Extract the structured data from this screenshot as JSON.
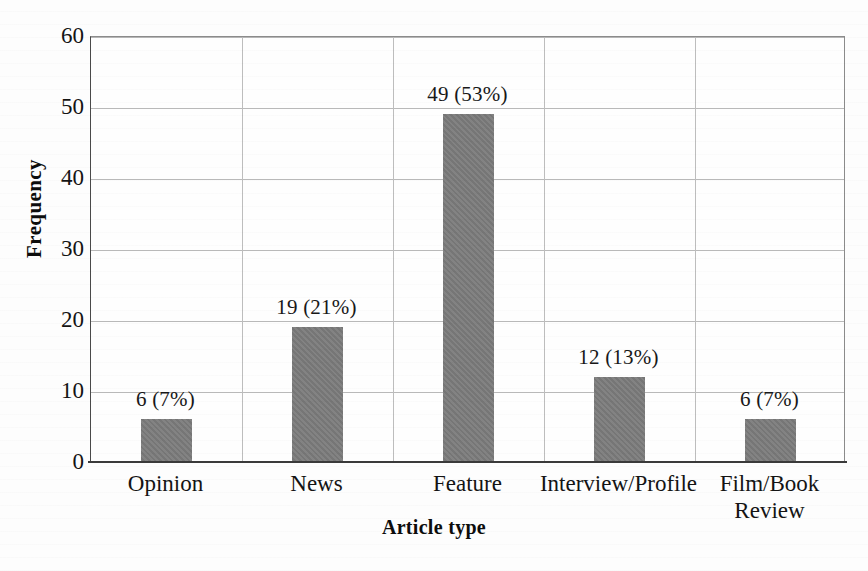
{
  "chart_data": {
    "type": "bar",
    "title": "",
    "xlabel": "Article type",
    "ylabel": "Frequency",
    "categories": [
      "Opinion",
      "News",
      "Feature",
      "Interview/Profile",
      "Film/Book\nReview"
    ],
    "values": [
      6,
      19,
      49,
      12,
      6
    ],
    "percentages": [
      7,
      21,
      53,
      13,
      7
    ],
    "point_labels": [
      "6 (7%)",
      "19 (21%)",
      "49 (53%)",
      "12 (13%)",
      "6 (7%)"
    ],
    "ylim": [
      0,
      60
    ],
    "yticks": [
      0,
      10,
      20,
      30,
      40,
      50,
      60
    ],
    "ytick_labels": [
      "0",
      "10",
      "20",
      "30",
      "40",
      "50",
      "60"
    ],
    "grid": true,
    "grid_axis": "both",
    "legend": false,
    "legend_position": "none",
    "bar_color": "#7c7c7c",
    "gridline_color": "#b9b9b9",
    "axis_color": "#3a3a3a",
    "background_color": "#fdfdfd"
  },
  "axis": {
    "y_title": "Frequency",
    "x_title": "Article type"
  }
}
